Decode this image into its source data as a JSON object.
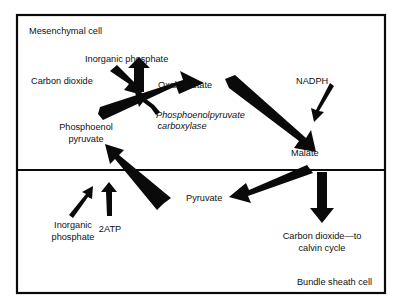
{
  "diagram": {
    "compartments": [
      {
        "id": "mesenchymal",
        "label": "Mesenchymal cell"
      },
      {
        "id": "bundle_sheath",
        "label": "Bundle sheath cell"
      }
    ],
    "colors": {
      "stroke": "#0a0a0a",
      "text": "#101010",
      "background": "#ffffff"
    },
    "labels": {
      "mesenchymal_cell": "Mesenchymal cell",
      "inorganic_phosphate_top": "Inorganic phosphate",
      "carbon_dioxide_in": "Carbon dioxide",
      "oxaloacetate": "Oxaloacetate",
      "nadph": "NADPH",
      "enzyme_line1": "Phosphoenolpyruvate",
      "enzyme_line2": "carboxylase",
      "phosphoenol_line1": "Phosphoenol",
      "phosphoenol_line2": "pyruvate",
      "malate": "Malate",
      "pyruvate": "Pyruvate",
      "inorganic_phosphate_bottom_line1": "Inorganic",
      "inorganic_phosphate_bottom_line2": "phosphate",
      "two_atp": "2ATP",
      "carbon_dioxide_out_line1": "Carbon dioxide—to",
      "carbon_dioxide_out_line2": "calvin cycle",
      "bundle_sheath_cell": "Bundle sheath cell"
    },
    "arrows": [
      {
        "id": "co2-to-oaa",
        "from": "Carbon dioxide",
        "to": "Oxaloacetate junction",
        "weight": "medium"
      },
      {
        "id": "pi-release",
        "from": "Oxaloacetate junction",
        "to": "Inorganic phosphate",
        "weight": "medium"
      },
      {
        "id": "pep-to-oaa",
        "from": "Phosphoenol pyruvate",
        "to": "Oxaloacetate",
        "weight": "thick"
      },
      {
        "id": "enzyme-pointer",
        "from": "Phosphoenolpyruvate carboxylase",
        "to": "pep-to-oaa reaction",
        "weight": "thin"
      },
      {
        "id": "oaa-to-malate",
        "from": "Oxaloacetate",
        "to": "Malate",
        "weight": "thick"
      },
      {
        "id": "nadph-to-malate",
        "from": "NADPH",
        "to": "Malate",
        "weight": "thin"
      },
      {
        "id": "malate-to-pyruvate",
        "from": "Malate",
        "to": "Pyruvate",
        "weight": "thick"
      },
      {
        "id": "pyruvate-to-pep",
        "from": "Pyruvate",
        "to": "Phosphoenol pyruvate",
        "weight": "thick"
      },
      {
        "id": "pi-input",
        "from": "Inorganic phosphate",
        "to": "pyruvate-to-pep reaction",
        "weight": "thin"
      },
      {
        "id": "atp-input",
        "from": "2ATP",
        "to": "pyruvate-to-pep reaction",
        "weight": "thin"
      },
      {
        "id": "co2-to-calvin",
        "from": "Malate decarboxylation",
        "to": "Carbon dioxide—to calvin cycle",
        "weight": "medium"
      }
    ]
  }
}
